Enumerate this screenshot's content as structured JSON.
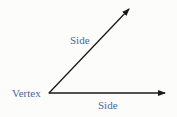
{
  "diagram": {
    "labels": {
      "vertex": "Vertex",
      "side_upper": "Side",
      "side_lower": "Side"
    },
    "colors": {
      "label": "#4a6a9e",
      "line": "#1a1a1a",
      "background": "#fcfcfb"
    },
    "geometry": {
      "vertex": [
        49,
        93
      ],
      "upper_ray_end": [
        130,
        8
      ],
      "lower_ray_end": [
        166,
        93
      ]
    }
  }
}
